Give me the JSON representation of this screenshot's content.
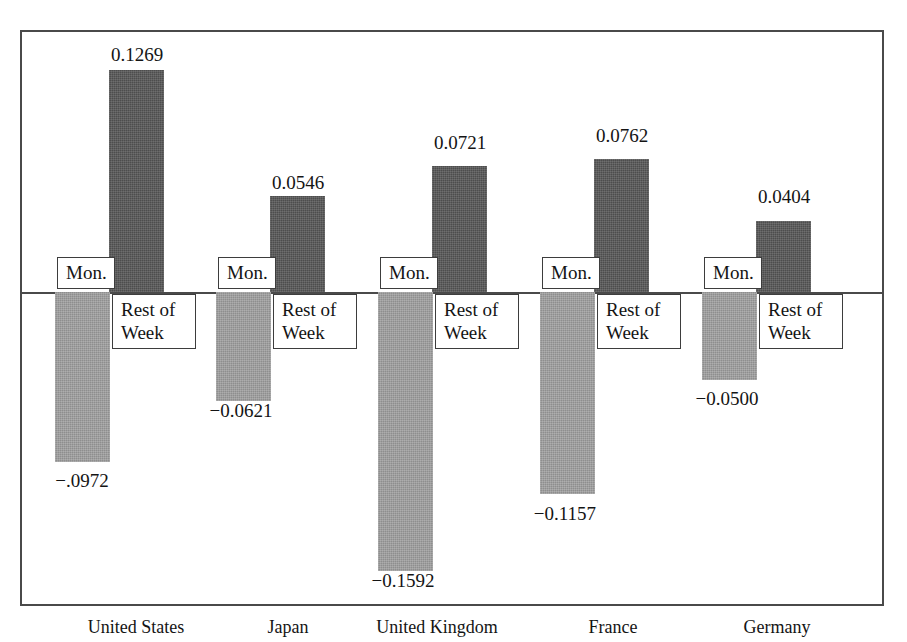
{
  "figure": {
    "title_fragment": "",
    "frame": {
      "x": 20,
      "y": 30,
      "width": 864,
      "height": 576
    },
    "zero_line_y": 292
  },
  "series_labels": {
    "negative": "Mon.",
    "positive_line1": "Rest of",
    "positive_line2": "Week"
  },
  "chart_data": {
    "type": "bar",
    "title": "",
    "xlabel": "",
    "ylabel": "",
    "grid": false,
    "legend": "inline-bar-labels",
    "zero_reference_line": true,
    "categories": [
      "United States",
      "Japan",
      "United Kingdom",
      "France",
      "Germany"
    ],
    "series": [
      {
        "name": "Mon.",
        "color": "#8e8e8e",
        "values": [
          -0.0972,
          -0.0621,
          -0.1592,
          -0.1157,
          -0.05
        ],
        "value_labels": [
          "−.0972",
          "−0.0621",
          "−0.1592",
          "−0.1157",
          "−0.0500"
        ]
      },
      {
        "name": "Rest of Week",
        "color": "#4d4d4d",
        "values": [
          0.1269,
          0.0546,
          0.0721,
          0.0762,
          0.0404
        ],
        "value_labels": [
          "0.1269",
          "0.0546",
          "0.0721",
          "0.0762",
          "0.0404"
        ]
      }
    ],
    "ylim": [
      -0.18,
      0.15
    ]
  },
  "groups": [
    {
      "category": "United States",
      "cat_label_x": 56,
      "cat_label_w": 160,
      "neg": {
        "x": 55,
        "w": 55,
        "label": "−.0972",
        "label_x": 27,
        "label_y": 470
      },
      "pos": {
        "x": 109,
        "w": 55,
        "label": "0.1269",
        "label_x": 82,
        "label_y": 44
      },
      "mon_box": {
        "x": 57,
        "y": 257
      },
      "week_box": {
        "x": 112,
        "y": 294
      }
    },
    {
      "category": "Japan",
      "cat_label_x": 228,
      "cat_label_w": 120,
      "neg": {
        "x": 216,
        "w": 55,
        "label": "−0.0621",
        "label_x": 186,
        "label_y": 400
      },
      "pos": {
        "x": 270,
        "w": 55,
        "label": "0.0546",
        "label_x": 243,
        "label_y": 172
      },
      "mon_box": {
        "x": 218,
        "y": 257
      },
      "week_box": {
        "x": 273,
        "y": 294
      }
    },
    {
      "category": "United Kingdom",
      "cat_label_x": 337,
      "cat_label_w": 200,
      "neg": {
        "x": 378,
        "w": 55,
        "label": "−0.1592",
        "label_x": 348,
        "label_y": 570
      },
      "pos": {
        "x": 432,
        "w": 55,
        "label": "0.0721",
        "label_x": 405,
        "label_y": 132
      },
      "mon_box": {
        "x": 380,
        "y": 257
      },
      "week_box": {
        "x": 435,
        "y": 294
      }
    },
    {
      "category": "France",
      "cat_label_x": 548,
      "cat_label_w": 130,
      "neg": {
        "x": 540,
        "w": 55,
        "label": "−0.1157",
        "label_x": 510,
        "label_y": 503
      },
      "pos": {
        "x": 594,
        "w": 55,
        "label": "0.0762",
        "label_x": 567,
        "label_y": 125
      },
      "mon_box": {
        "x": 542,
        "y": 257
      },
      "week_box": {
        "x": 597,
        "y": 294
      }
    },
    {
      "category": "Germany",
      "cat_label_x": 702,
      "cat_label_w": 150,
      "neg": {
        "x": 702,
        "w": 55,
        "label": "−0.0500",
        "label_x": 672,
        "label_y": 388
      },
      "pos": {
        "x": 756,
        "w": 55,
        "label": "0.0404",
        "label_x": 729,
        "label_y": 186
      },
      "mon_box": {
        "x": 704,
        "y": 257
      },
      "week_box": {
        "x": 759,
        "y": 294
      }
    }
  ]
}
